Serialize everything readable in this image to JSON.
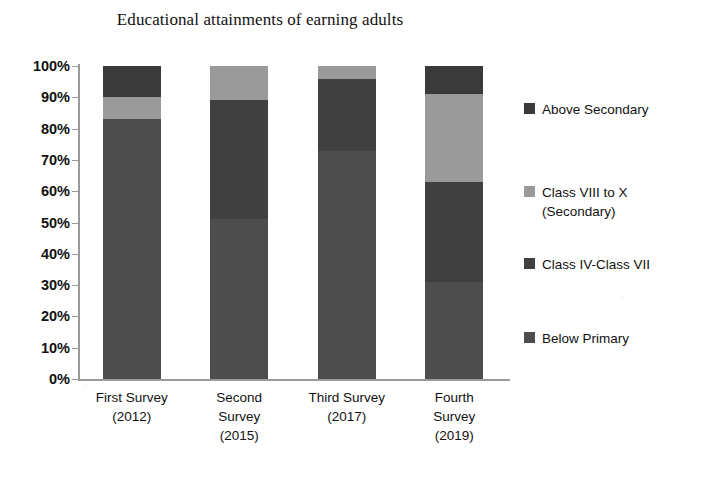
{
  "chart_data": {
    "type": "bar",
    "subtype": "stacked-100-percent",
    "title": "Educational attainments of earning adults",
    "xlabel": "",
    "ylabel": "",
    "ylim": [
      0,
      100
    ],
    "ytick_labels": [
      "100%",
      "90%",
      "80%",
      "70%",
      "60%",
      "50%",
      "40%",
      "30%",
      "20%",
      "10%",
      "0%"
    ],
    "ytick_values": [
      100,
      90,
      80,
      70,
      60,
      50,
      40,
      30,
      20,
      10,
      0
    ],
    "grid": false,
    "legend_position": "right",
    "categories": [
      "First Survey (2012)",
      "Second Survey (2015)",
      "Third Survey (2017)",
      "Fourth Survey (2019)"
    ],
    "category_lines": [
      [
        "First Survey",
        "(2012)"
      ],
      [
        "Second",
        "Survey",
        "(2015)"
      ],
      [
        "Third Survey",
        "(2017)"
      ],
      [
        "Fourth",
        "Survey",
        "(2019)"
      ]
    ],
    "series": [
      {
        "name": "Below Primary",
        "color": "#4d4d4d",
        "values": [
          83,
          51,
          73,
          31
        ]
      },
      {
        "name": "Class IV-Class VII",
        "color": "#404040",
        "values": [
          0,
          38,
          23,
          32
        ]
      },
      {
        "name": "Class VIII to X (Secondary)",
        "color": "#9a9a9a",
        "values": [
          7,
          11,
          4,
          28
        ]
      },
      {
        "name": "Above Secondary",
        "color": "#3a3a3a",
        "values": [
          10,
          0,
          0,
          9
        ]
      }
    ],
    "legend_entries": [
      {
        "label": "Above Secondary",
        "color": "#3a3a3a"
      },
      {
        "label": "Class VIII to X\n(Secondary)",
        "color": "#9a9a9a"
      },
      {
        "label": "Class IV-Class VII",
        "color": "#404040"
      },
      {
        "label": "Below Primary",
        "color": "#4d4d4d"
      }
    ],
    "axis_color": "#9a9a9a",
    "background_color": "#ffffff"
  }
}
